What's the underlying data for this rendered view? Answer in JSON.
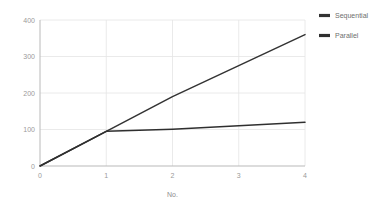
{
  "chart_data": {
    "type": "line",
    "title": "",
    "subtitle": "",
    "xlabel": "No.",
    "ylabel": "",
    "x": [
      0,
      1,
      2,
      3,
      4
    ],
    "xticklabels": [
      "0",
      "1",
      "2",
      "3",
      "4"
    ],
    "yticks": [
      0,
      100,
      200,
      300,
      400
    ],
    "yticklabels": [
      "0",
      "100",
      "200",
      "300",
      "400"
    ],
    "xlim": [
      0,
      4
    ],
    "ylim": [
      0,
      400
    ],
    "grid": true,
    "legend_position": "right-top",
    "series": [
      {
        "name": "Sequential",
        "values": [
          0,
          95,
          190,
          275,
          360
        ],
        "color": "#333333"
      },
      {
        "name": "Parallel",
        "values": [
          0,
          95,
          101,
          110,
          120
        ],
        "color": "#2f2f2f"
      }
    ]
  },
  "axes": {
    "x_axis_title": "No.",
    "y_axis_title": ""
  },
  "legend": {
    "entries": [
      {
        "label": "Sequential",
        "marker": "line-marker",
        "color": "#333333"
      },
      {
        "label": "Parallel",
        "marker": "line-marker",
        "color": "#2f2f2f"
      }
    ]
  },
  "colors": {
    "background": "#ffffff",
    "grid": "#e4e4e4",
    "axis": "#b9b9b9",
    "tick_text": "#9a9a9a",
    "legend_text": "#6e6e6e",
    "series_1": "#333333",
    "series_2": "#2f2f2f"
  }
}
